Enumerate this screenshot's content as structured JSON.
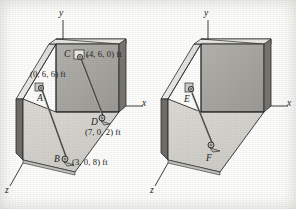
{
  "figure": {
    "kind": "engineering-statics-3d-diagram",
    "colors": {
      "page_background": "#fdfdfb",
      "floor_fill": "#d7d6d0",
      "wall_fill": "#a9a8a3",
      "wall_top_edge": "#e6e5e0",
      "wall_side_dark": "#6f6e6a",
      "slab_light": "#ebeae5",
      "outline": "#2a2a2a",
      "cable": "#4a4a47",
      "label_text": "#242424"
    }
  },
  "panels": [
    {
      "id": "left-panel",
      "name": "labeled-view",
      "axes": [
        {
          "name": "y-axis",
          "label": "y"
        },
        {
          "name": "x-axis",
          "label": "x"
        },
        {
          "name": "z-axis",
          "label": "z"
        }
      ],
      "points": [
        {
          "name": "point-a",
          "label": "A",
          "coord": "(0, 6, 6) ft"
        },
        {
          "name": "point-b",
          "label": "B",
          "coord": "(3, 0, 8) ft"
        },
        {
          "name": "point-c",
          "label": "C",
          "coord": "(4, 6, 0) ft"
        },
        {
          "name": "point-d",
          "label": "D",
          "coord": "(7, 0, 2) ft"
        }
      ],
      "cables": [
        {
          "name": "cable-ab",
          "from": "A",
          "to": "B"
        },
        {
          "name": "cable-cd",
          "from": "C",
          "to": "D"
        }
      ]
    },
    {
      "id": "right-panel",
      "name": "unlabeled-view",
      "axes": [
        {
          "name": "y-axis",
          "label": "y"
        },
        {
          "name": "x-axis",
          "label": "x"
        },
        {
          "name": "z-axis",
          "label": "z"
        }
      ],
      "points": [
        {
          "name": "point-e",
          "label": "E"
        },
        {
          "name": "point-f",
          "label": "F"
        }
      ],
      "cables": [
        {
          "name": "cable-ef",
          "from": "E",
          "to": "F"
        }
      ]
    }
  ],
  "labels": {
    "left": {
      "axis_y": "y",
      "axis_x": "x",
      "axis_z": "z",
      "a": "A",
      "b": "B",
      "c": "C",
      "d": "D",
      "coord_a": "(0, 6, 6) ft",
      "coord_b": "(3, 0, 8) ft",
      "coord_c": "(4, 6, 0) ft",
      "coord_d": "(7, 0, 2) ft"
    },
    "right": {
      "axis_y": "y",
      "axis_x": "x",
      "axis_z": "z",
      "e": "E",
      "f": "F"
    }
  }
}
